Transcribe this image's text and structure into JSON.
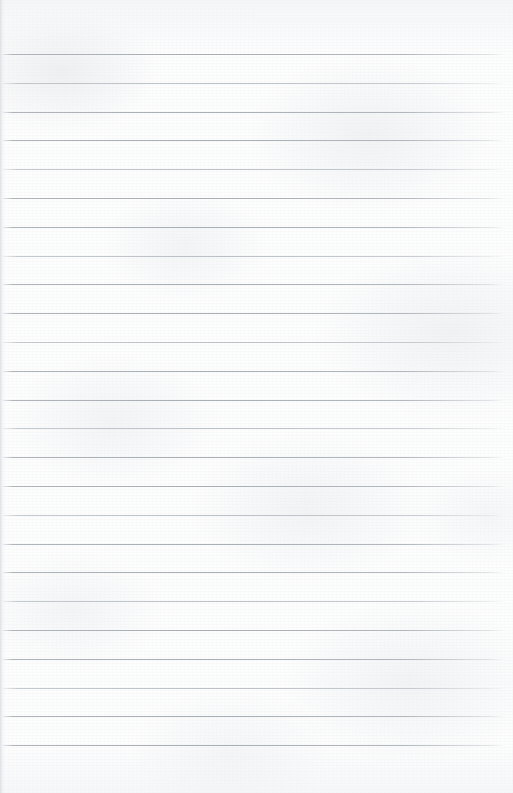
{
  "document": {
    "type": "lined-notebook-page",
    "title": "",
    "content_text": "",
    "page_width": 513,
    "page_height": 793,
    "background_color": "#fdfdfd",
    "paper_tint": "#fcfcfc",
    "rule_color": "#a8aeb5",
    "rule_soft_color": "#b4bac0",
    "left_edge_shade_color": "#d6dade",
    "is_blank": true
  },
  "ruling": {
    "style": "wide-ruled-horizontal",
    "line_count": 25,
    "first_line_y": 54,
    "line_spacing": 28.8,
    "line_thickness": 1,
    "line_start_x": 3,
    "line_end_x": 505,
    "has_margin_rule": false,
    "has_holes": false,
    "lines_y": [
      54,
      82.8,
      111.6,
      140.4,
      169.2,
      198,
      226.8,
      255.6,
      284.4,
      313.2,
      342,
      370.8,
      399.6,
      428.4,
      457.2,
      486,
      514.8,
      543.6,
      572.4,
      601.2,
      630,
      658.8,
      687.6,
      716.4,
      745.2
    ]
  },
  "margins": {
    "top_blank_height": 54,
    "bottom_blank_height": 48,
    "left_edge_band_width": 5
  }
}
